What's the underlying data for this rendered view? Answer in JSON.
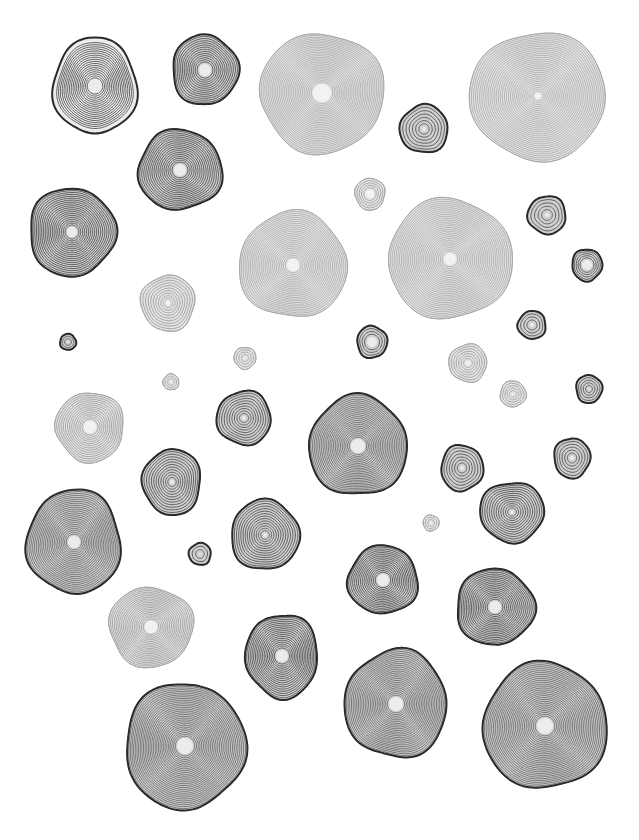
{
  "canvas": {
    "width": 639,
    "height": 840,
    "background": "#ffffff"
  },
  "styles": {
    "dark": {
      "stroke": "#2a2a2a",
      "ring": "#555555",
      "fill": "#cfcfcf",
      "core": "#ececec",
      "outline_w": 2.0
    },
    "mid": {
      "stroke": "#3a3a3a",
      "ring": "#6a6a6a",
      "fill": "#d6d6d6",
      "core": "#eeeeee",
      "outline_w": 1.6
    },
    "light": {
      "stroke": "#a8a8a8",
      "ring": "#a0a0a0",
      "fill": "#e3e3e3",
      "core": "#f2f2f2",
      "outline_w": 1.0
    }
  },
  "blobs": [
    {
      "cx": 95,
      "cy": 86,
      "rx": 42,
      "ry": 48,
      "rings": 18,
      "core": 6,
      "style": "dark",
      "halo": true
    },
    {
      "cx": 205,
      "cy": 70,
      "rx": 33,
      "ry": 35,
      "rings": 14,
      "core": 6,
      "style": "dark"
    },
    {
      "cx": 322,
      "cy": 93,
      "rx": 62,
      "ry": 60,
      "rings": 30,
      "core": 9,
      "style": "light"
    },
    {
      "cx": 538,
      "cy": 96,
      "rx": 68,
      "ry": 64,
      "rings": 32,
      "core": 3,
      "style": "light"
    },
    {
      "cx": 424,
      "cy": 129,
      "rx": 24,
      "ry": 24,
      "rings": 7,
      "core": 2,
      "style": "dark"
    },
    {
      "cx": 180,
      "cy": 170,
      "rx": 42,
      "ry": 40,
      "rings": 18,
      "core": 6,
      "style": "dark"
    },
    {
      "cx": 72,
      "cy": 232,
      "rx": 43,
      "ry": 44,
      "rings": 20,
      "core": 5,
      "style": "dark"
    },
    {
      "cx": 370,
      "cy": 194,
      "rx": 15,
      "ry": 16,
      "rings": 5,
      "core": 4,
      "style": "light"
    },
    {
      "cx": 547,
      "cy": 215,
      "rx": 19,
      "ry": 19,
      "rings": 5,
      "core": 2,
      "style": "dark"
    },
    {
      "cx": 293,
      "cy": 265,
      "rx": 54,
      "ry": 53,
      "rings": 26,
      "core": 6,
      "style": "light"
    },
    {
      "cx": 450,
      "cy": 259,
      "rx": 62,
      "ry": 60,
      "rings": 30,
      "core": 6,
      "style": "light"
    },
    {
      "cx": 587,
      "cy": 265,
      "rx": 15,
      "ry": 16,
      "rings": 5,
      "core": 5,
      "style": "dark"
    },
    {
      "cx": 168,
      "cy": 303,
      "rx": 27,
      "ry": 28,
      "rings": 10,
      "core": 2,
      "style": "light"
    },
    {
      "cx": 532,
      "cy": 325,
      "rx": 14,
      "ry": 14,
      "rings": 4,
      "core": 2,
      "style": "dark"
    },
    {
      "cx": 68,
      "cy": 342,
      "rx": 8,
      "ry": 8,
      "rings": 3,
      "core": 1,
      "style": "dark"
    },
    {
      "cx": 372,
      "cy": 342,
      "rx": 15,
      "ry": 16,
      "rings": 4,
      "core": 5,
      "style": "dark"
    },
    {
      "cx": 245,
      "cy": 358,
      "rx": 11,
      "ry": 11,
      "rings": 4,
      "core": 1,
      "style": "light"
    },
    {
      "cx": 468,
      "cy": 363,
      "rx": 19,
      "ry": 19,
      "rings": 7,
      "core": 2,
      "style": "light"
    },
    {
      "cx": 171,
      "cy": 382,
      "rx": 8,
      "ry": 8,
      "rings": 3,
      "core": 1,
      "style": "light"
    },
    {
      "cx": 513,
      "cy": 394,
      "rx": 13,
      "ry": 13,
      "rings": 5,
      "core": 1,
      "style": "light"
    },
    {
      "cx": 589,
      "cy": 389,
      "rx": 13,
      "ry": 14,
      "rings": 5,
      "core": 1,
      "style": "dark"
    },
    {
      "cx": 90,
      "cy": 427,
      "rx": 34,
      "ry": 35,
      "rings": 14,
      "core": 6,
      "style": "light"
    },
    {
      "cx": 244,
      "cy": 418,
      "rx": 27,
      "ry": 27,
      "rings": 10,
      "core": 2,
      "style": "dark"
    },
    {
      "cx": 358,
      "cy": 446,
      "rx": 49,
      "ry": 50,
      "rings": 24,
      "core": 7,
      "style": "dark"
    },
    {
      "cx": 462,
      "cy": 468,
      "rx": 21,
      "ry": 23,
      "rings": 7,
      "core": 2,
      "style": "dark"
    },
    {
      "cx": 572,
      "cy": 458,
      "rx": 18,
      "ry": 20,
      "rings": 6,
      "core": 2,
      "style": "dark"
    },
    {
      "cx": 172,
      "cy": 482,
      "rx": 29,
      "ry": 33,
      "rings": 12,
      "core": 2,
      "style": "dark"
    },
    {
      "cx": 74,
      "cy": 542,
      "rx": 47,
      "ry": 52,
      "rings": 24,
      "core": 6,
      "style": "dark"
    },
    {
      "cx": 265,
      "cy": 535,
      "rx": 34,
      "ry": 35,
      "rings": 14,
      "core": 2,
      "style": "dark"
    },
    {
      "cx": 431,
      "cy": 523,
      "rx": 8,
      "ry": 8,
      "rings": 3,
      "core": 1,
      "style": "light"
    },
    {
      "cx": 512,
      "cy": 512,
      "rx": 32,
      "ry": 30,
      "rings": 13,
      "core": 2,
      "style": "dark"
    },
    {
      "cx": 200,
      "cy": 554,
      "rx": 11,
      "ry": 11,
      "rings": 3,
      "core": 1,
      "style": "dark"
    },
    {
      "cx": 383,
      "cy": 580,
      "rx": 35,
      "ry": 34,
      "rings": 16,
      "core": 6,
      "style": "dark"
    },
    {
      "cx": 495,
      "cy": 607,
      "rx": 39,
      "ry": 38,
      "rings": 18,
      "core": 6,
      "style": "dark"
    },
    {
      "cx": 151,
      "cy": 627,
      "rx": 42,
      "ry": 40,
      "rings": 20,
      "core": 6,
      "style": "light"
    },
    {
      "cx": 282,
      "cy": 656,
      "rx": 36,
      "ry": 42,
      "rings": 18,
      "core": 6,
      "style": "dark"
    },
    {
      "cx": 396,
      "cy": 704,
      "rx": 51,
      "ry": 54,
      "rings": 26,
      "core": 7,
      "style": "dark"
    },
    {
      "cx": 545,
      "cy": 726,
      "rx": 62,
      "ry": 63,
      "rings": 30,
      "core": 8,
      "style": "dark"
    },
    {
      "cx": 185,
      "cy": 746,
      "rx": 60,
      "ry": 63,
      "rings": 30,
      "core": 8,
      "style": "dark"
    }
  ]
}
